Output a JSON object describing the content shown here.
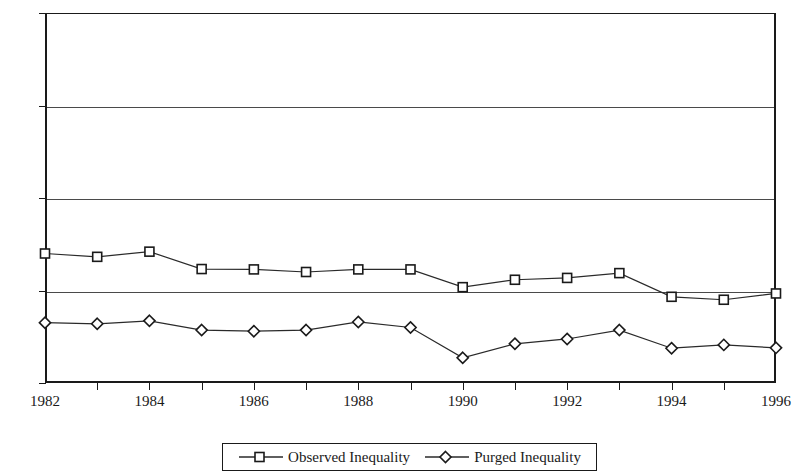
{
  "chart_data": {
    "type": "line",
    "title": "",
    "subtitle": "",
    "xlabel": "",
    "ylabel": "",
    "x": [
      1982,
      1983,
      1984,
      1985,
      1986,
      1987,
      1988,
      1989,
      1990,
      1991,
      1992,
      1993,
      1994,
      1995,
      1996
    ],
    "categories": [
      "1982",
      "1983",
      "1984",
      "1985",
      "1986",
      "1987",
      "1988",
      "1989",
      "1990",
      "1991",
      "1992",
      "1993",
      "1994",
      "1995",
      "1996"
    ],
    "series": [
      {
        "name": "Observed Inequality",
        "marker": "square",
        "values": [
          0.35,
          0.341,
          0.355,
          0.308,
          0.307,
          0.3,
          0.307,
          0.307,
          0.259,
          0.279,
          0.284,
          0.297,
          0.233,
          0.225,
          0.242
        ]
      },
      {
        "name": "Purged Inequality",
        "marker": "diamond",
        "values": [
          0.163,
          0.16,
          0.168,
          0.143,
          0.14,
          0.143,
          0.165,
          0.15,
          0.068,
          0.106,
          0.119,
          0.143,
          0.094,
          0.103,
          0.095
        ]
      }
    ],
    "xlim": [
      1982,
      1996
    ],
    "ylim": [
      0.0,
      1.0
    ],
    "ytick_labels": [
      "1.00",
      "0.75",
      "0.50",
      "0.25",
      "0.00"
    ],
    "ytick_values": [
      1.0,
      0.75,
      0.5,
      0.25,
      0.0
    ],
    "xtick_labels": [
      "1982",
      "1984",
      "1986",
      "1988",
      "1990",
      "1992",
      "1994",
      "1996"
    ],
    "xtick_values": [
      1982,
      1984,
      1986,
      1988,
      1990,
      1992,
      1994,
      1996
    ],
    "grid": true,
    "grid_axis": "y",
    "legend_position": "bottom-center",
    "line_color": "#2a2a2a",
    "marker_fill": "#ffffff",
    "marker_edge": "#1a1a1a",
    "background_color": "#ffffff"
  },
  "legend": {
    "entries": [
      {
        "label": "Observed Inequality",
        "marker": "square-marker-icon"
      },
      {
        "label": "Purged Inequality",
        "marker": "diamond-marker-icon"
      }
    ]
  }
}
